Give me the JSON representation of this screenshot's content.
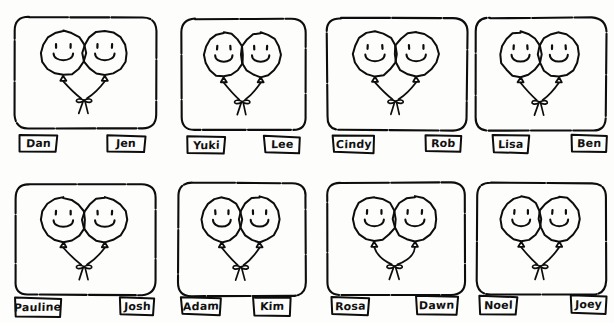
{
  "scene": {
    "title": "Pairs of balloon faces with name labels",
    "style": "hand-drawn-sketch",
    "background_color": "#fdfdfc",
    "ink_color": "#0d0d0d",
    "grid": {
      "columns": 4,
      "rows": 2
    }
  },
  "panels": [
    {
      "id": "panel-1",
      "row": 0,
      "col": 0,
      "box": {
        "x": 14,
        "y": 16,
        "w": 143,
        "h": 114
      },
      "balloons": [
        {
          "face": "smiley",
          "eyes": 2,
          "mouth": "u-smile"
        },
        {
          "face": "smiley",
          "eyes": 2,
          "mouth": "u-smile"
        }
      ],
      "labels": [
        {
          "name": "Dan",
          "box": {
            "x": 18,
            "y": 134,
            "w": 40,
            "h": 19
          }
        },
        {
          "name": "Jen",
          "box": {
            "x": 106,
            "y": 134,
            "w": 40,
            "h": 19
          }
        }
      ]
    },
    {
      "id": "panel-2",
      "row": 0,
      "col": 1,
      "box": {
        "x": 180,
        "y": 18,
        "w": 127,
        "h": 113
      },
      "balloons": [
        {
          "face": "smiley",
          "eyes": 2,
          "mouth": "u-smile"
        },
        {
          "face": "smiley",
          "eyes": 2,
          "mouth": "u-smile"
        }
      ],
      "labels": [
        {
          "name": "Yuki",
          "box": {
            "x": 186,
            "y": 135,
            "w": 40,
            "h": 20
          }
        },
        {
          "name": "Lee",
          "box": {
            "x": 263,
            "y": 135,
            "w": 38,
            "h": 19
          }
        }
      ]
    },
    {
      "id": "panel-3",
      "row": 0,
      "col": 2,
      "box": {
        "x": 326,
        "y": 17,
        "w": 142,
        "h": 114
      },
      "balloons": [
        {
          "face": "smiley",
          "eyes": 2,
          "mouth": "u-smile"
        },
        {
          "face": "smiley",
          "eyes": 2,
          "mouth": "u-smile"
        }
      ],
      "labels": [
        {
          "name": "Cindy",
          "box": {
            "x": 332,
            "y": 134,
            "w": 43,
            "h": 20
          }
        },
        {
          "name": "Rob",
          "box": {
            "x": 424,
            "y": 134,
            "w": 38,
            "h": 19
          }
        }
      ]
    },
    {
      "id": "panel-4",
      "row": 0,
      "col": 3,
      "box": {
        "x": 475,
        "y": 17,
        "w": 132,
        "h": 115
      },
      "balloons": [
        {
          "face": "smiley",
          "eyes": 2,
          "mouth": "u-smile"
        },
        {
          "face": "smiley",
          "eyes": 2,
          "mouth": "u-smile"
        }
      ],
      "labels": [
        {
          "name": "Lisa",
          "box": {
            "x": 492,
            "y": 134,
            "w": 38,
            "h": 20
          }
        },
        {
          "name": "Ben",
          "box": {
            "x": 570,
            "y": 134,
            "w": 38,
            "h": 19
          }
        }
      ]
    },
    {
      "id": "panel-5",
      "row": 1,
      "col": 0,
      "box": {
        "x": 14,
        "y": 183,
        "w": 143,
        "h": 113
      },
      "balloons": [
        {
          "face": "smiley",
          "eyes": 2,
          "mouth": "u-smile"
        },
        {
          "face": "smiley",
          "eyes": 2,
          "mouth": "u-smile"
        }
      ],
      "labels": [
        {
          "name": "Pauline",
          "box": {
            "x": 14,
            "y": 297,
            "w": 48,
            "h": 21
          }
        },
        {
          "name": "Josh",
          "box": {
            "x": 119,
            "y": 296,
            "w": 36,
            "h": 20
          }
        }
      ]
    },
    {
      "id": "panel-6",
      "row": 1,
      "col": 1,
      "box": {
        "x": 177,
        "y": 182,
        "w": 130,
        "h": 115
      },
      "balloons": [
        {
          "face": "smiley",
          "eyes": 2,
          "mouth": "u-smile"
        },
        {
          "face": "smiley",
          "eyes": 2,
          "mouth": "u-smile"
        }
      ],
      "labels": [
        {
          "name": "Adam",
          "box": {
            "x": 180,
            "y": 296,
            "w": 42,
            "h": 20
          }
        },
        {
          "name": "Kim",
          "box": {
            "x": 252,
            "y": 296,
            "w": 40,
            "h": 21
          }
        }
      ]
    },
    {
      "id": "panel-7",
      "row": 1,
      "col": 2,
      "box": {
        "x": 326,
        "y": 182,
        "w": 140,
        "h": 114
      },
      "balloons": [
        {
          "face": "smiley",
          "eyes": 2,
          "mouth": "u-smile"
        },
        {
          "face": "smiley",
          "eyes": 2,
          "mouth": "u-smile"
        }
      ],
      "labels": [
        {
          "name": "Rosa",
          "box": {
            "x": 330,
            "y": 296,
            "w": 40,
            "h": 20
          }
        },
        {
          "name": "Dawn",
          "box": {
            "x": 415,
            "y": 295,
            "w": 44,
            "h": 21
          }
        }
      ]
    },
    {
      "id": "panel-8",
      "row": 1,
      "col": 3,
      "box": {
        "x": 476,
        "y": 182,
        "w": 131,
        "h": 114
      },
      "balloons": [
        {
          "face": "smiley",
          "eyes": 2,
          "mouth": "u-smile"
        },
        {
          "face": "smiley",
          "eyes": 2,
          "mouth": "u-smile"
        }
      ],
      "labels": [
        {
          "name": "Noel",
          "box": {
            "x": 478,
            "y": 295,
            "w": 40,
            "h": 21
          }
        },
        {
          "name": "Joey",
          "box": {
            "x": 570,
            "y": 294,
            "w": 38,
            "h": 21
          }
        }
      ]
    }
  ]
}
